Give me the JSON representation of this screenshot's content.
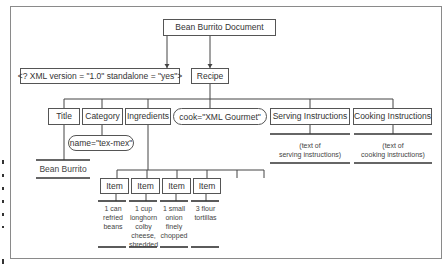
{
  "diagram": {
    "root": "Bean Burrito Document",
    "xml_declaration": "<? XML version = \"1.0\" standalone = \"yes\">",
    "recipe": "Recipe",
    "children": {
      "title": "Title",
      "category": "Category",
      "ingredients": "Ingredients",
      "cook_attribute": "cook=\"XML Gourmet\"",
      "serving": "Serving Instructions",
      "cooking": "Cooking Instructions"
    },
    "category_attribute": "name=\"tex-mex\"",
    "title_text": "Bean Burrito",
    "serving_text": [
      "(text of",
      "serving instructions)"
    ],
    "cooking_text": [
      "(text of",
      "cooking instructions)"
    ],
    "items": [
      {
        "label": "Item",
        "text": [
          "1 can",
          "refried",
          "beans"
        ]
      },
      {
        "label": "Item",
        "text": [
          "1 cup",
          "longhorn",
          "colby",
          "cheese,",
          "shredded"
        ]
      },
      {
        "label": "Item",
        "text": [
          "1 small",
          "onion",
          "finely",
          "chopped"
        ]
      },
      {
        "label": "Item",
        "text": [
          "3 flour",
          "tortillas"
        ]
      }
    ]
  }
}
